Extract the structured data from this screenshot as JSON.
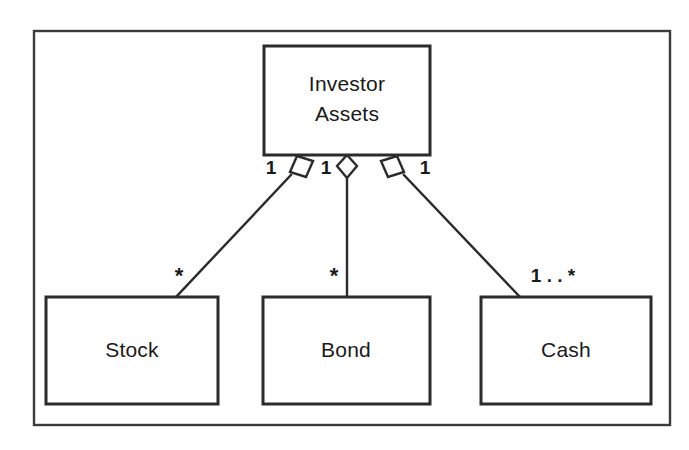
{
  "diagram": {
    "type": "uml-class-diagram",
    "frame": {
      "visible": true,
      "color": "#3b3b3b"
    },
    "colors": {
      "line": "#2b2b2b",
      "frame": "#3b3b3b",
      "box_fill": "#ffffff",
      "text": "#1a1a1a",
      "background": "#ffffff"
    },
    "classes": [
      {
        "id": "investor-assets",
        "name_line1": "Investor",
        "name_line2": "Assets"
      },
      {
        "id": "stock",
        "name": "Stock"
      },
      {
        "id": "bond",
        "name": "Bond"
      },
      {
        "id": "cash",
        "name": "Cash"
      }
    ],
    "relationships": [
      {
        "id": "assets-stock",
        "kind": "aggregation",
        "whole": "Investor Assets",
        "part": "Stock",
        "whole_multiplicity": "1",
        "part_multiplicity": "*",
        "diamond": "hollow"
      },
      {
        "id": "assets-bond",
        "kind": "aggregation",
        "whole": "Investor Assets",
        "part": "Bond",
        "whole_multiplicity": "1",
        "part_multiplicity": "*",
        "diamond": "hollow"
      },
      {
        "id": "assets-cash",
        "kind": "aggregation",
        "whole": "Investor Assets",
        "part": "Cash",
        "whole_multiplicity": "1",
        "part_multiplicity": "1 . . *",
        "diamond": "hollow"
      }
    ]
  }
}
